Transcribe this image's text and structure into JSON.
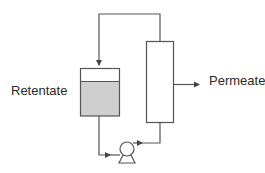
{
  "diagram": {
    "type": "process-flow",
    "labels": {
      "retentate": "Retentate",
      "permeate": "Permeate"
    },
    "components": [
      {
        "id": "retentate-tank",
        "kind": "tank",
        "label_ref": "retentate"
      },
      {
        "id": "pump",
        "kind": "pump"
      },
      {
        "id": "membrane-module",
        "kind": "membrane-column"
      },
      {
        "id": "permeate-outlet",
        "kind": "outlet-arrow",
        "label_ref": "permeate"
      }
    ],
    "flows": [
      {
        "from": "retentate-tank",
        "to": "pump"
      },
      {
        "from": "pump",
        "to": "membrane-module"
      },
      {
        "from": "membrane-module",
        "to": "retentate-tank",
        "note": "recirculation loop over top"
      },
      {
        "from": "membrane-module",
        "to": "permeate-outlet"
      }
    ],
    "colors": {
      "line": "#555555",
      "liquid": "#cfcfcf",
      "text": "#2a2a2a",
      "background": "#ffffff"
    }
  }
}
